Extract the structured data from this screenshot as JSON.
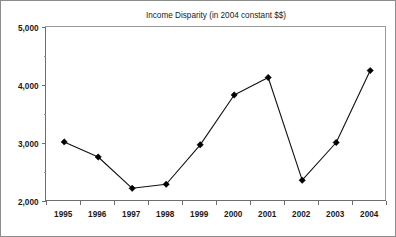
{
  "chart_data": {
    "type": "line",
    "title": "Income Disparity (in 2004 constant $$)",
    "xlabel": "",
    "ylabel": "",
    "categories": [
      "1995",
      "1996",
      "1997",
      "1998",
      "1999",
      "2000",
      "2001",
      "2002",
      "2003",
      "2004"
    ],
    "values": [
      3010,
      2750,
      2210,
      2280,
      2960,
      3820,
      4120,
      2350,
      3000,
      4240
    ],
    "series": [
      {
        "name": "Income Disparity",
        "values": [
          3010,
          2750,
          2210,
          2280,
          2960,
          3820,
          4120,
          2350,
          3000,
          4240
        ]
      }
    ],
    "ylim": [
      2000,
      5000
    ],
    "ytick_labels": [
      "5,000",
      "4,000",
      "3,000",
      "2,000"
    ],
    "ytick_values": [
      5000,
      4000,
      3000,
      2000
    ],
    "ytick_minor_values": [
      4500,
      3500,
      2500
    ],
    "xtick_labels": [
      "1995",
      "1996",
      "1997",
      "1998",
      "1999",
      "2000",
      "2001",
      "2002",
      "2003",
      "2004"
    ],
    "grid": false,
    "legend": null,
    "legend_position": "none",
    "marker": "diamond",
    "line_color": "#111111",
    "marker_color": "#000000"
  },
  "figure": {
    "border_color": "#8c8c8c",
    "background": "#ffffff"
  }
}
